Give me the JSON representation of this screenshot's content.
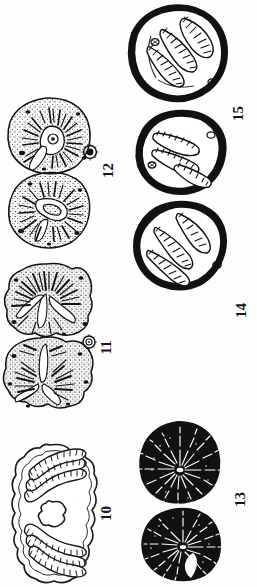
{
  "plate": {
    "kind": "scientific-illustration-plate",
    "orientation": "rotated-90-ccw",
    "medium": "black ink line drawing on white paper",
    "background_color": "#fdfdfd",
    "ink_color": "#111114",
    "width_px": 257,
    "height_px": 587,
    "figure_count": 6
  },
  "figures": [
    {
      "number": "10",
      "label": "10",
      "style": "outline",
      "description": "Bilaterally symmetric outlined section with two mirrored groups of curved striated (ladder-like) bands surrounding a central irregular lobed cavity; scalloped outer margin.",
      "band_count": 6,
      "position": "lower-left"
    },
    {
      "number": "11",
      "label": "11",
      "style": "stippled",
      "description": "Two heavily stippled lobed sections, upper larger with radiating dark clefts, lower smaller with a central notch; a tiny stippled detail circle sits beside the label.",
      "has_detail_circle": true,
      "position": "middle-left"
    },
    {
      "number": "12",
      "label": "12",
      "style": "stippled",
      "description": "Two stippled sections; the upper has a pale central ring/hilum with short radiating dark ribs, the lower shows a pale curved central channel; a tiny detail circle sits beside the label.",
      "has_detail_circle": true,
      "position": "upper-left"
    },
    {
      "number": "13",
      "label": "13",
      "style": "solid-black",
      "description": "Two solid black rounded sections filled with fine white radiating dashes emanating from a bright central point; one is nearly circular, the other reniform with a notch.",
      "position": "lower-right"
    },
    {
      "number": "14",
      "label": "14",
      "style": "thick-outline",
      "description": "Two rounded cells with very thick black walls enclosing three to four elongated, transversely striated spindle-shaped bodies; a tiny oval body lies at one margin.",
      "body_count": 4,
      "position": "middle-right"
    },
    {
      "number": "15",
      "label": "15",
      "style": "thick-outline",
      "description": "Two rounded cells with heavy black walls containing three to four elongated transversely striated bodies plus faint arc-shaped outlines; a small oval body at the lower margin.",
      "body_count": 4,
      "position": "upper-right"
    }
  ]
}
